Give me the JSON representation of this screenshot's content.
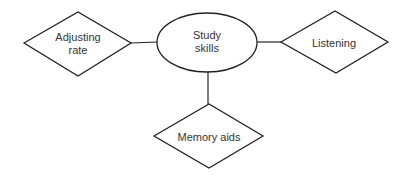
{
  "diagram": {
    "type": "mind-map",
    "stroke_color": "#222222",
    "text_color": "#333333",
    "background": "#ffffff",
    "center": {
      "label_line1": "Study",
      "label_line2": "skills",
      "shape": "ellipse"
    },
    "nodes": [
      {
        "id": "adjusting-rate",
        "label_line1": "Adjusting",
        "label_line2": "rate",
        "shape": "diamond",
        "position": "left"
      },
      {
        "id": "listening",
        "label_line1": "Listening",
        "shape": "diamond",
        "position": "right"
      },
      {
        "id": "memory-aids",
        "label_line1": "Memory aids",
        "shape": "diamond",
        "position": "bottom"
      }
    ]
  }
}
